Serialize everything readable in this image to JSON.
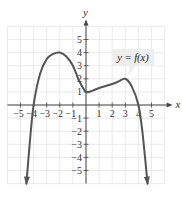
{
  "chart_data": {
    "type": "line",
    "title": "",
    "xlabel": "x",
    "ylabel": "y",
    "xlim": [
      -6,
      6
    ],
    "ylim": [
      -6,
      6
    ],
    "grid": true,
    "x_ticks": [
      -5,
      -4,
      -3,
      -2,
      -1,
      1,
      2,
      3,
      4,
      5
    ],
    "y_ticks": [
      -5,
      -4,
      -3,
      -2,
      -1,
      1,
      2,
      3,
      4,
      5
    ],
    "x_tick_labels": [
      "−5",
      "−4",
      "−3",
      "−2",
      "−1",
      "1",
      "2",
      "3",
      "4",
      "5"
    ],
    "y_tick_labels": [
      "−5",
      "−4",
      "−3",
      "−2",
      "−1",
      "1",
      "2",
      "3",
      "4",
      "5"
    ],
    "annotation": "y = f(x)",
    "series": [
      {
        "name": "y = f(x)",
        "points": [
          [
            -4.55,
            -6
          ],
          [
            -4.3,
            -3
          ],
          [
            -4.0,
            0
          ],
          [
            -3.5,
            2.4
          ],
          [
            -3.0,
            3.5
          ],
          [
            -2.5,
            3.9
          ],
          [
            -2.0,
            4.0
          ],
          [
            -1.5,
            3.7
          ],
          [
            -1.0,
            3.0
          ],
          [
            -0.5,
            1.8
          ],
          [
            0.0,
            1.0
          ],
          [
            0.5,
            1.1
          ],
          [
            1.0,
            1.3
          ],
          [
            2.0,
            1.6
          ],
          [
            2.5,
            1.8
          ],
          [
            3.0,
            2.0
          ],
          [
            3.5,
            1.4
          ],
          [
            4.0,
            0.0
          ],
          [
            4.3,
            -2.0
          ],
          [
            4.7,
            -6
          ]
        ],
        "key_points": {
          "x_intercepts": [
            -4,
            4
          ],
          "y_intercept": 1,
          "local_max": [
            [
              -2,
              4
            ],
            [
              3,
              2
            ]
          ],
          "local_min": [
            [
              0,
              1
            ]
          ]
        },
        "end_behavior": "both ends arrow downward"
      }
    ]
  },
  "colors": {
    "curve": "#555555",
    "grid": "#e4e4e4",
    "axis": "#444444",
    "label_box": "#eeeeee"
  }
}
